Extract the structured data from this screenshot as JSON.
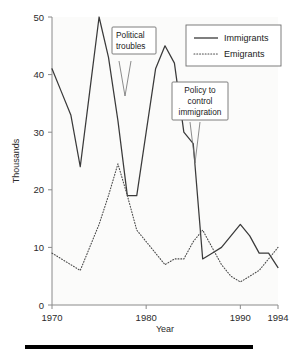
{
  "chart_data": {
    "type": "line",
    "title": "",
    "xlabel": "Year",
    "ylabel": "Thousands",
    "xlim": [
      1970,
      1994
    ],
    "ylim": [
      0,
      50
    ],
    "grid": false,
    "legend_position": "top-right",
    "x": [
      1970,
      1971,
      1972,
      1973,
      1974,
      1975,
      1976,
      1977,
      1978,
      1979,
      1980,
      1981,
      1982,
      1983,
      1984,
      1985,
      1986,
      1987,
      1988,
      1989,
      1990,
      1991,
      1992,
      1993,
      1994
    ],
    "xticks": [
      1970,
      1980,
      1990,
      1994
    ],
    "xtick_labels": [
      "1970",
      "1980",
      "1990",
      "1994"
    ],
    "yticks": [
      0,
      10,
      20,
      30,
      40,
      50
    ],
    "ytick_labels": [
      "0",
      "10",
      "20",
      "30",
      "40",
      "50"
    ],
    "series": [
      {
        "name": "Immigrants",
        "style": "solid",
        "color": "#3a3a3a",
        "values": [
          41,
          37,
          33,
          24,
          37,
          50,
          43,
          32,
          19,
          19,
          30,
          41,
          45,
          42,
          30,
          28,
          8,
          9,
          10,
          12,
          14,
          12,
          9,
          9,
          6.5
        ]
      },
      {
        "name": "Emigrants",
        "style": "dotted",
        "color": "#4a4a4a",
        "values": [
          9,
          8,
          7,
          6,
          10,
          14,
          19,
          24.5,
          19,
          13,
          11,
          9,
          7,
          8,
          8,
          11,
          13,
          10,
          7,
          5,
          4,
          5,
          6,
          8,
          10
        ]
      }
    ],
    "annotations": [
      {
        "id": "political-troubles",
        "lines": [
          "Political",
          "troubles"
        ],
        "text": "Political troubles",
        "align": "left",
        "points_to_year": 1978,
        "points_to_value": 19
      },
      {
        "id": "policy-to-control-immigration",
        "lines": [
          "Policy to",
          "control",
          "immigration"
        ],
        "text": "Policy to control immigration",
        "align": "center",
        "points_to_year": 1986,
        "points_to_value": 8
      }
    ]
  },
  "legend": {
    "entries": [
      {
        "label": "Immigrants",
        "style": "solid"
      },
      {
        "label": "Emigrants",
        "style": "dotted"
      }
    ]
  },
  "axes": {
    "y_title": "Thousands",
    "x_title": "Year"
  },
  "colors": {
    "immigrants": "#3a3a3a",
    "emigrants": "#4a4a4a",
    "axis": "#8a8a8a",
    "plot_background": "#fbfbfa",
    "rule": "#000000"
  }
}
